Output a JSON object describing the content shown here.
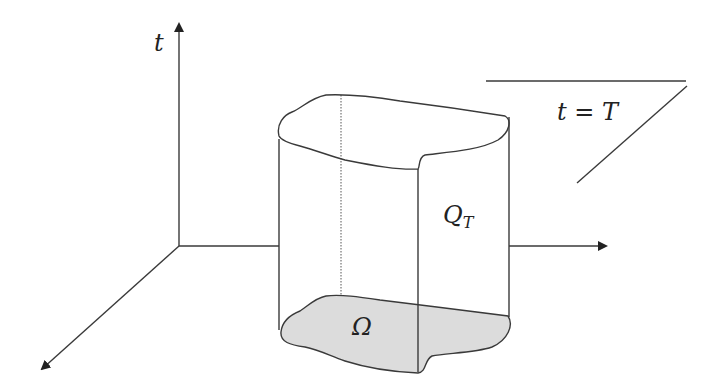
{
  "figure": {
    "labels": {
      "time_axis": "t",
      "top_plane": "t = T",
      "cylinder": "Q",
      "cylinder_subscript": "T",
      "base_domain": "Ω"
    },
    "colors": {
      "stroke": "#3a3a3a",
      "base_fill": "#dcdcdc",
      "background": "#ffffff"
    }
  }
}
